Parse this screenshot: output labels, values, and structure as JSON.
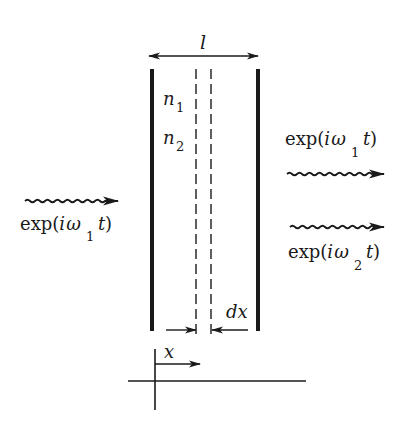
{
  "diagram": {
    "type": "physics-schematic",
    "colors": {
      "ink": "#1a1a1a",
      "background": "#ffffff"
    },
    "labels": {
      "thickness": "l",
      "index1_base": "n",
      "index1_sub": "1",
      "index2_base": "n",
      "index2_sub": "2",
      "slice_width": "dx",
      "position": "x"
    },
    "input_wave": {
      "prefix": "exp(",
      "i": "i",
      "omega": "ω",
      "sub": "1",
      "t": "t",
      "suffix": ")"
    },
    "output_waves": [
      {
        "prefix": "exp(",
        "i": "i",
        "omega": "ω",
        "sub": "1",
        "t": "t",
        "suffix": ")"
      },
      {
        "prefix": "exp(",
        "i": "i",
        "omega": "ω",
        "sub": "2",
        "t": "t",
        "suffix": ")"
      }
    ]
  }
}
